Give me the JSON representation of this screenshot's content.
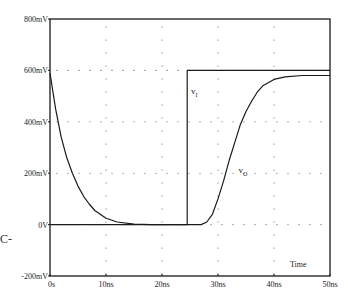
{
  "chart_data": {
    "type": "line",
    "title": "",
    "xlabel": "Time",
    "ylabel": "",
    "xlim": [
      0,
      50
    ],
    "ylim": [
      -200,
      800
    ],
    "x_unit": "ns",
    "y_unit": "mV",
    "x_ticks": [
      0,
      10,
      20,
      30,
      40,
      50
    ],
    "x_tick_labels": [
      "0s",
      "10ns",
      "20ns",
      "30ns",
      "40ns",
      "50ns"
    ],
    "y_ticks": [
      -200,
      0,
      200,
      400,
      600,
      800
    ],
    "y_tick_labels": [
      "-200mV",
      "0V",
      "200mV",
      "400mV",
      "600mV",
      "800mV"
    ],
    "grid": "dotted",
    "legend": "inline labels",
    "series": [
      {
        "name": "vI",
        "label_main": "v",
        "label_sub": "I",
        "x": [
          0,
          24.5,
          24.5,
          50
        ],
        "values": [
          0,
          0,
          600,
          600
        ]
      },
      {
        "name": "vO",
        "label_main": "v",
        "label_sub": "O",
        "x": [
          0,
          1,
          2,
          3,
          4,
          5,
          6,
          7,
          8,
          10,
          12,
          15,
          18,
          27,
          28,
          29,
          30,
          31,
          32,
          33,
          34,
          35,
          36,
          37,
          38,
          40,
          42,
          45,
          50
        ],
        "values": [
          590,
          450,
          340,
          260,
          200,
          150,
          110,
          80,
          55,
          25,
          10,
          2,
          0,
          0,
          10,
          40,
          100,
          170,
          250,
          320,
          390,
          440,
          480,
          515,
          540,
          565,
          575,
          580,
          580
        ]
      }
    ],
    "annotations": [
      {
        "text": "vI",
        "x": 25,
        "y": 510
      },
      {
        "text": "vO",
        "x": 34,
        "y": 200
      },
      {
        "text": "Time",
        "x": 45,
        "y": -150
      }
    ]
  },
  "margin_artifact": "C-",
  "colors": {
    "line": "#1a1a1a",
    "grid": "#555555",
    "background": "#ffffff"
  }
}
